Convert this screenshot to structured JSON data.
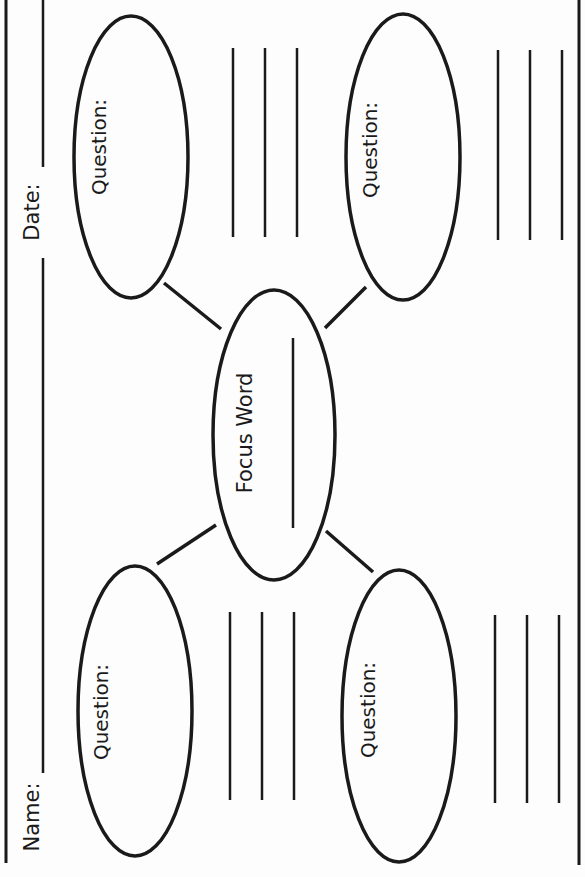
{
  "worksheet": {
    "header": {
      "name_label": "Name:",
      "date_label": "Date:"
    },
    "center": {
      "label": "Focus Word"
    },
    "question_bubbles": [
      {
        "position": "top-left",
        "label": "Question:"
      },
      {
        "position": "top-right",
        "label": "Question:"
      },
      {
        "position": "bottom-left",
        "label": "Question:"
      },
      {
        "position": "bottom-right",
        "label": "Question:"
      }
    ],
    "answer_line_count_per_question": 3
  },
  "colors": {
    "ink": "#1a1a1a",
    "paper": "#fdfdfd"
  }
}
